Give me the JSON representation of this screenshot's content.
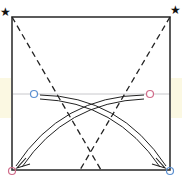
{
  "diagram": {
    "type": "origami-fold-step",
    "markers": {
      "star_glyph": "★",
      "top_left_star": "★",
      "top_right_star": "★"
    },
    "colors": {
      "outline": "#333333",
      "dashed_fold": "#222222",
      "reference_line": "#c8c8cc",
      "blue_marker": "#5b8fd0",
      "pink_marker": "#d06c8a",
      "band": "#fbf8e2",
      "arrow": "#222222"
    },
    "elements": {
      "square": "paper-outline",
      "fold_lines": [
        "dashed-fold-left-diagonal",
        "dashed-fold-right-diagonal"
      ],
      "reference_line": "horizontal-crease",
      "circles": [
        {
          "name": "blue-point-left",
          "color": "blue"
        },
        {
          "name": "pink-point-right",
          "color": "pink"
        },
        {
          "name": "pink-target-bottom-left",
          "color": "pink"
        },
        {
          "name": "blue-target-bottom-right",
          "color": "blue"
        }
      ],
      "arrows": [
        {
          "from": "blue-point-left",
          "to": "blue-target-bottom-right"
        },
        {
          "from": "pink-point-right",
          "to": "pink-target-bottom-left"
        }
      ]
    }
  }
}
